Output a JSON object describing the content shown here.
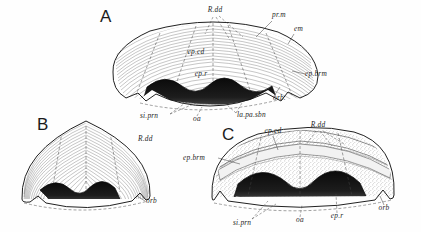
{
  "plate": {
    "background_color": "#ffffff",
    "ink_color": "#151515",
    "description": "Line-drawing plate of three shell (brachiopod) specimens in anterior view, labelled A, B and C with italic anatomical abbreviations and leader lines."
  },
  "figures": [
    {
      "id": "A",
      "letter": "A",
      "letter_pos": {
        "x": 100,
        "y": 22
      },
      "style": "fine concentric growth-line hatching with dashed fold lines",
      "labels": [
        {
          "key": "rdd",
          "text": "R.dd",
          "x": 215,
          "y": 12,
          "anchor": "middle"
        },
        {
          "key": "prm",
          "text": "pr.m",
          "x": 272,
          "y": 17,
          "anchor": "start"
        },
        {
          "key": "em",
          "text": "em",
          "x": 294,
          "y": 31,
          "anchor": "start"
        },
        {
          "key": "ep_cd",
          "text": "ep.cd",
          "x": 196,
          "y": 54,
          "anchor": "middle"
        },
        {
          "key": "ep_r",
          "text": "ep.r",
          "x": 201,
          "y": 76,
          "anchor": "middle"
        },
        {
          "key": "ep_brm",
          "text": "ep.brm",
          "x": 305,
          "y": 76,
          "anchor": "start"
        },
        {
          "key": "orb",
          "text": "orb.",
          "x": 273,
          "y": 100,
          "anchor": "start"
        },
        {
          "key": "si_prn",
          "text": "si.prn",
          "x": 140,
          "y": 118,
          "anchor": "start"
        },
        {
          "key": "oa",
          "text": "oa",
          "x": 197,
          "y": 121,
          "anchor": "middle"
        },
        {
          "key": "la_pa_sbn",
          "text": "la.pa.sbn",
          "x": 237,
          "y": 117,
          "anchor": "start"
        }
      ]
    },
    {
      "id": "B",
      "letter": "B",
      "letter_pos": {
        "x": 37,
        "y": 130
      },
      "style": "dense concentric growth lines, exterior view",
      "labels": [
        {
          "key": "rdd",
          "text": "R.dd",
          "x": 138,
          "y": 141,
          "anchor": "start"
        },
        {
          "key": "orb",
          "text": "orb",
          "x": 146,
          "y": 203,
          "anchor": "start"
        }
      ]
    },
    {
      "id": "C",
      "letter": "C",
      "letter_pos": {
        "x": 222,
        "y": 140
      },
      "style": "stippled granular shading, oblique view",
      "labels": [
        {
          "key": "ep_cd",
          "text": "ep.cd",
          "x": 273,
          "y": 133,
          "anchor": "middle"
        },
        {
          "key": "rdd",
          "text": "R.dd",
          "x": 318,
          "y": 127,
          "anchor": "middle"
        },
        {
          "key": "ep_brm",
          "text": "ep.brm",
          "x": 183,
          "y": 160,
          "anchor": "start"
        },
        {
          "key": "orb",
          "text": "orb",
          "x": 384,
          "y": 210,
          "anchor": "middle"
        },
        {
          "key": "si_prn",
          "text": "si.prn",
          "x": 233,
          "y": 225,
          "anchor": "start"
        },
        {
          "key": "oa",
          "text": "oa",
          "x": 300,
          "y": 222,
          "anchor": "middle"
        },
        {
          "key": "ep_r",
          "text": "ep.r",
          "x": 337,
          "y": 218,
          "anchor": "middle"
        }
      ]
    }
  ],
  "abbreviations": {
    "R.dd": "R.dd",
    "pr.m": "pr.m",
    "em": "em",
    "ep.cd": "ep.cd",
    "ep.r": "ep.r",
    "ep.brm": "ep.brm",
    "orb": "orb",
    "si.prn": "si.prn",
    "oa": "oa",
    "la.pa.sbn": "la.pa.sbn"
  }
}
